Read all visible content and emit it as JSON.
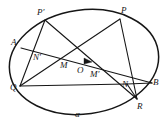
{
  "figure": {
    "shape_name": "ellipse",
    "curve_label": "α",
    "stroke_color": "#161616",
    "background_color": "#ffffff",
    "ellipse": {
      "cx": 84,
      "cy": 62,
      "rx": 75,
      "ry": 52,
      "rotation_deg": -8
    },
    "points": [
      {
        "id": "A",
        "label": "A",
        "x": 21,
        "y": 48,
        "label_x": 11,
        "label_y": 38,
        "on_curve": true
      },
      {
        "id": "Pprime",
        "label": "P′",
        "x": 45,
        "y": 20,
        "label_x": 37,
        "label_y": 8,
        "on_curve": true
      },
      {
        "id": "P",
        "label": "P",
        "x": 120,
        "y": 19,
        "label_x": 121,
        "label_y": 6,
        "on_curve": true
      },
      {
        "id": "B",
        "label": "B",
        "x": 152,
        "y": 83,
        "label_x": 153,
        "label_y": 78,
        "on_curve": true
      },
      {
        "id": "R",
        "label": "R",
        "x": 137,
        "y": 99,
        "label_x": 137,
        "label_y": 102,
        "on_curve": true
      },
      {
        "id": "Q",
        "label": "Q",
        "x": 20,
        "y": 86,
        "label_x": 10,
        "label_y": 83,
        "on_curve": true
      },
      {
        "id": "Nprime",
        "label": "N′",
        "x": 41,
        "y": 54,
        "label_x": 33,
        "label_y": 53,
        "on_curve": false
      },
      {
        "id": "M",
        "label": "M",
        "x": 68,
        "y": 64,
        "label_x": 60,
        "label_y": 61,
        "on_curve": false
      },
      {
        "id": "O",
        "label": "O",
        "x": 83,
        "y": 68,
        "label_x": 77,
        "label_y": 66,
        "on_curve": false
      },
      {
        "id": "Mprime",
        "label": "M′",
        "x": 99,
        "y": 70,
        "label_x": 90,
        "label_y": 70,
        "on_curve": false
      },
      {
        "id": "N",
        "label": "N",
        "x": 127,
        "y": 84,
        "label_x": 122,
        "label_y": 80,
        "on_curve": false
      }
    ],
    "curve_label_pos": {
      "x": 75,
      "y": 110
    },
    "chords": [
      {
        "name": "chord-A-B",
        "from": "A",
        "to": "B"
      },
      {
        "name": "chord-Pprime-Q",
        "from": "Pprime",
        "to": "Q"
      },
      {
        "name": "chord-Pprime-R",
        "from": "Pprime",
        "to": "R"
      },
      {
        "name": "chord-P-Q",
        "from": "P",
        "to": "Q"
      },
      {
        "name": "chord-P-R",
        "from": "P",
        "to": "R"
      },
      {
        "name": "segment-Q-N",
        "from": "Q",
        "to": "N"
      },
      {
        "name": "segment-N-B",
        "from": "N",
        "to": "B"
      },
      {
        "name": "segment-N-R",
        "from": "N",
        "to": "R"
      }
    ],
    "arrow": {
      "name": "direction-arrow",
      "x": 88,
      "y": 61,
      "angle_deg": 20
    }
  }
}
